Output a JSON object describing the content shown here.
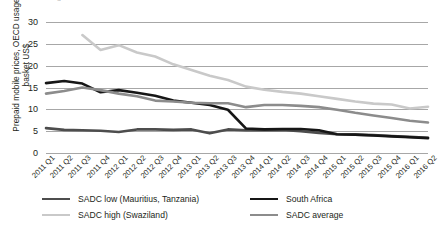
{
  "figure": {
    "title_fragment": "g",
    "background": "#ffffff"
  },
  "chart_data": {
    "type": "line",
    "title": "",
    "subtitle": "",
    "xlabel": "",
    "ylabel": "Prepaid mobile prices, OECD usage basket US$",
    "ylim": [
      0,
      30
    ],
    "yticks": [
      0,
      5,
      10,
      15,
      20,
      25,
      30
    ],
    "ytick_labels": [
      "0",
      "5",
      "10",
      "15",
      "20",
      "25",
      "30"
    ],
    "grid": "horizontal",
    "legend_position": "bottom",
    "categories": [
      "2011 Q1",
      "2011 Q2",
      "2011 Q3",
      "2011 Q4",
      "2012 Q1",
      "2012 Q2",
      "2012 Q3",
      "2012 Q4",
      "2013 Q1",
      "2013 Q2",
      "2013 Q3",
      "2013 Q4",
      "2014 Q1",
      "2014 Q2",
      "2014 Q3",
      "2014 Q4",
      "2015 Q1",
      "2015 Q2",
      "2015 Q3",
      "2015 Q4",
      "2016 Q1",
      "2016 Q2"
    ],
    "series": [
      {
        "name": "SADC low (Mauritius, Tanzania)",
        "color": "#4d4d4d",
        "width": 2.6,
        "values": [
          5.7,
          5.3,
          5.2,
          5.1,
          4.8,
          5.4,
          5.4,
          5.3,
          5.4,
          4.5,
          5.4,
          5.2,
          5.2,
          5.3,
          5.0,
          4.6,
          4.3,
          4.2,
          4.1,
          3.9,
          3.7,
          3.5
        ]
      },
      {
        "name": "South Africa",
        "color": "#161616",
        "width": 2.6,
        "values": [
          16.0,
          16.5,
          15.9,
          13.9,
          14.4,
          13.8,
          13.1,
          12.0,
          11.5,
          11.0,
          9.9,
          5.6,
          5.4,
          5.5,
          5.5,
          5.2,
          4.3,
          4.2,
          4.0,
          3.8,
          3.6,
          3.4
        ]
      },
      {
        "name": "SADC high (Swaziland)",
        "color": "#c9c9c9",
        "width": 2.6,
        "values": [
          null,
          null,
          27.0,
          23.6,
          24.7,
          23.0,
          22.1,
          20.3,
          19.0,
          17.7,
          16.7,
          15.2,
          14.5,
          14.0,
          13.6,
          13.0,
          12.4,
          11.8,
          11.3,
          11.1,
          10.2,
          10.6
        ]
      },
      {
        "name": "SADC average",
        "color": "#8c8c8c",
        "width": 2.6,
        "values": [
          13.6,
          14.2,
          15.0,
          14.4,
          13.6,
          13.0,
          12.0,
          11.8,
          11.5,
          11.4,
          11.4,
          10.5,
          11.0,
          11.0,
          10.8,
          10.5,
          9.9,
          9.2,
          8.6,
          8.0,
          7.4,
          7.0
        ]
      }
    ]
  },
  "legend": {
    "items": [
      {
        "label": "SADC low (Mauritius, Tanzania)",
        "color": "#4d4d4d",
        "width": 2.8
      },
      {
        "label": "South Africa",
        "color": "#161616",
        "width": 2.8
      },
      {
        "label": "SADC high (Swaziland)",
        "color": "#c9c9c9",
        "width": 2.4
      },
      {
        "label": "SADC average",
        "color": "#8c8c8c",
        "width": 2.4
      }
    ]
  }
}
